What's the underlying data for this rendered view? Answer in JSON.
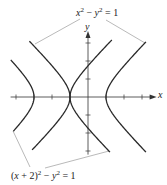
{
  "figure": {
    "type": "hyperbola-plot",
    "colors": {
      "curve": "#2a2a2a",
      "axis": "#333333",
      "leader": "#8a8a8a",
      "text": "#222222"
    },
    "origin_px": [
      88,
      97
    ],
    "unit_px": 18,
    "axes": {
      "x_label": "x",
      "y_label": "y",
      "x_range": [
        -4.3,
        3.7
      ],
      "y_range": [
        -3.2,
        3.55
      ],
      "x_ticks": [
        -4,
        -3,
        -2,
        -1,
        1,
        2,
        3
      ],
      "y_ticks": [
        -3,
        -2,
        -1,
        1,
        2,
        3
      ]
    },
    "curves": [
      {
        "name": "x2-minus-y2-eq-1",
        "equation": "x^2 - y^2 = 1",
        "h": 0,
        "branches": [
          {
            "side": "right",
            "y_min": -3.06,
            "y_max": 3.06
          },
          {
            "side": "left",
            "y_min": -2.94,
            "y_max": 3.1
          }
        ]
      },
      {
        "name": "x-plus-2-squared-minus-y2-eq-1",
        "equation": "(x + 2)^2 - y^2 = 1",
        "h": -2,
        "branches": [
          {
            "side": "right",
            "y_min": -3.06,
            "y_max": 3.17
          },
          {
            "side": "left",
            "y_min": -1.9,
            "y_max": 2.06
          }
        ]
      }
    ],
    "annotations": {
      "top": {
        "text_parts": [
          "x",
          "2",
          " − ",
          "y",
          "2",
          " = 1"
        ],
        "plain": "x² − y² = 1",
        "left": 76,
        "top": 8
      },
      "bottom": {
        "text_parts": [
          "(",
          "x",
          " + 2)",
          "2",
          " − ",
          "y",
          "2",
          " = 1"
        ],
        "plain": "(x + 2)² − y² = 1",
        "left": 11,
        "top": 171
      }
    },
    "leaders": [
      {
        "from": [
          80,
          19
        ],
        "to": [
          35,
          44
        ]
      },
      {
        "from": [
          106,
          20
        ],
        "to": [
          145,
          43
        ]
      },
      {
        "from": [
          30,
          167
        ],
        "to": [
          13,
          131
        ]
      },
      {
        "from": [
          45,
          168
        ],
        "to": [
          109,
          151
        ]
      }
    ]
  }
}
